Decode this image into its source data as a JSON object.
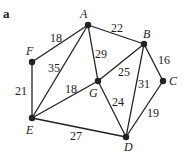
{
  "figure_label": "a",
  "nodes": [
    {
      "id": "A",
      "x": 88,
      "y": 25,
      "lx": 80,
      "ly": 18
    },
    {
      "id": "B",
      "x": 144,
      "y": 44,
      "lx": 143,
      "ly": 38
    },
    {
      "id": "C",
      "x": 163,
      "y": 81,
      "lx": 169,
      "ly": 85
    },
    {
      "id": "G",
      "x": 98,
      "y": 81,
      "lx": 89,
      "ly": 97
    },
    {
      "id": "F",
      "x": 32,
      "y": 62,
      "lx": 26,
      "ly": 55
    },
    {
      "id": "E",
      "x": 32,
      "y": 118,
      "lx": 26,
      "ly": 134
    },
    {
      "id": "D",
      "x": 126,
      "y": 137,
      "lx": 124,
      "ly": 151
    }
  ],
  "edges": [
    {
      "from": "A",
      "to": "B",
      "weight": "22",
      "lx": 111,
      "ly": 32
    },
    {
      "from": "A",
      "to": "F",
      "weight": "18",
      "lx": 50,
      "ly": 42
    },
    {
      "from": "A",
      "to": "E",
      "weight": "35",
      "lx": 48,
      "ly": 72
    },
    {
      "from": "A",
      "to": "G",
      "weight": "29",
      "lx": 95,
      "ly": 58
    },
    {
      "from": "B",
      "to": "C",
      "weight": "16",
      "lx": 158,
      "ly": 64
    },
    {
      "from": "B",
      "to": "G",
      "weight": "25",
      "lx": 118,
      "ly": 76
    },
    {
      "from": "B",
      "to": "D",
      "weight": "31",
      "lx": 138,
      "ly": 88
    },
    {
      "from": "F",
      "to": "E",
      "weight": "21",
      "lx": 15,
      "ly": 95
    },
    {
      "from": "E",
      "to": "G",
      "weight": "18",
      "lx": 65,
      "ly": 93
    },
    {
      "from": "G",
      "to": "D",
      "weight": "24",
      "lx": 112,
      "ly": 106
    },
    {
      "from": "C",
      "to": "D",
      "weight": "19",
      "lx": 147,
      "ly": 117
    },
    {
      "from": "E",
      "to": "D",
      "weight": "27",
      "lx": 70,
      "ly": 140
    }
  ]
}
